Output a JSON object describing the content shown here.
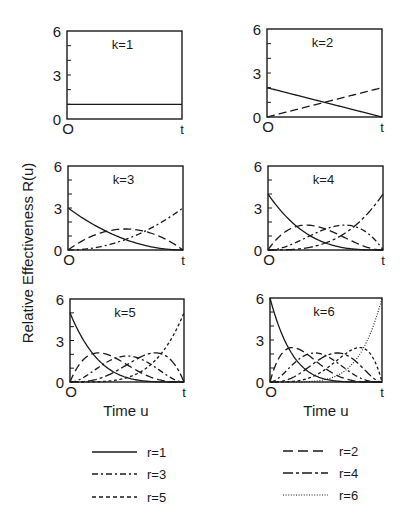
{
  "chart_data": {
    "type": "line",
    "title": "",
    "ylabel": "Relative Effectiveness R(u)",
    "xlabel": "Time u",
    "formula": "R_r(u) = k * C(k-1, r-1) * u^(r-1) * (1-u)^(k-r), u in [0,t] normalized",
    "ylim": [
      0,
      6
    ],
    "y_ticks": [
      "0",
      "3",
      "6"
    ],
    "x_ticks": [
      "O",
      "t"
    ],
    "grid": false,
    "legend_position": "bottom",
    "panels": [
      {
        "label": "k=1",
        "k": 1
      },
      {
        "label": "k=2",
        "k": 2
      },
      {
        "label": "k=3",
        "k": 3
      },
      {
        "label": "k=4",
        "k": 4
      },
      {
        "label": "k=5",
        "k": 5
      },
      {
        "label": "k=6",
        "k": 6
      }
    ],
    "series": [
      {
        "name": "r=1",
        "r": 1,
        "style": "solid"
      },
      {
        "name": "r=2",
        "r": 2,
        "style": "long-dash"
      },
      {
        "name": "r=3",
        "r": 3,
        "style": "dash-dot"
      },
      {
        "name": "r=4",
        "r": 4,
        "style": "long-dash-dot"
      },
      {
        "name": "r=5",
        "r": 5,
        "style": "short-dash"
      },
      {
        "name": "r=6",
        "r": 6,
        "style": "dotted"
      }
    ],
    "sample_values": {
      "x": [
        0,
        0.25,
        0.5,
        0.75,
        1
      ],
      "k1": {
        "r1": [
          1,
          1,
          1,
          1,
          1
        ]
      },
      "k2": {
        "r1": [
          2,
          1.5,
          1,
          0.5,
          0
        ],
        "r2": [
          0,
          0.5,
          1,
          1.5,
          2
        ]
      },
      "k3": {
        "r1": [
          3,
          1.69,
          0.75,
          0.19,
          0
        ],
        "r2": [
          0,
          1.13,
          1.5,
          1.13,
          0
        ],
        "r3": [
          0,
          0.19,
          0.75,
          1.69,
          3
        ]
      },
      "k4": {
        "r1": [
          4,
          1.69,
          0.5,
          0.06,
          0
        ],
        "r2": [
          0,
          1.69,
          1.5,
          0.56,
          0
        ],
        "r3": [
          0,
          0.56,
          1.5,
          1.69,
          0
        ],
        "r4": [
          0,
          0.06,
          0.5,
          1.69,
          4
        ]
      },
      "k5": {
        "r1": [
          5,
          1.58,
          0.31,
          0.02,
          0
        ],
        "r2": [
          0,
          2.11,
          1.25,
          0.23,
          0
        ],
        "r3": [
          0,
          1.05,
          1.88,
          1.05,
          0
        ],
        "r4": [
          0,
          0.23,
          1.25,
          2.11,
          0
        ],
        "r5": [
          0,
          0.02,
          0.31,
          1.58,
          5
        ]
      },
      "k6": {
        "r1": [
          6,
          1.42,
          0.19,
          0.01,
          0
        ],
        "r2": [
          0,
          2.37,
          0.94,
          0.09,
          0
        ],
        "r3": [
          0,
          1.58,
          1.88,
          0.53,
          0
        ],
        "r4": [
          0,
          0.53,
          1.88,
          1.58,
          0
        ],
        "r5": [
          0,
          0.09,
          0.94,
          2.37,
          0
        ],
        "r6": [
          0,
          0.01,
          0.19,
          1.42,
          6
        ]
      }
    }
  },
  "axis": {
    "ylabel": "Relative Effectiveness R(u)",
    "xlabel_left": "Time u",
    "xlabel_right": "Time u",
    "tick_0": "0",
    "tick_3": "3",
    "tick_6": "6",
    "x_start": "O",
    "x_end": "t"
  },
  "legend": {
    "items": [
      {
        "label": "r=1"
      },
      {
        "label": "r=2"
      },
      {
        "label": "r=3"
      },
      {
        "label": "r=4"
      },
      {
        "label": "r=5"
      },
      {
        "label": "r=6"
      }
    ]
  },
  "colors": {
    "ink": "#1a1a1a",
    "background": "#ffffff"
  }
}
